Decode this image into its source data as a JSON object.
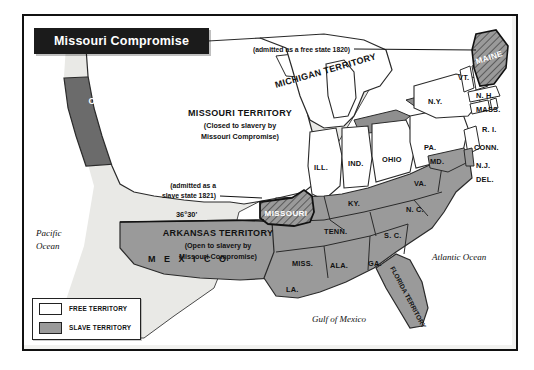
{
  "figure": {
    "title": "Missouri Compromise",
    "kind": "historical-thematic-map"
  },
  "legend": {
    "items": [
      {
        "label": "FREE TERRITORY",
        "swatch": "free",
        "color": "#ffffff"
      },
      {
        "label": "SLAVE TERRITORY",
        "swatch": "slave",
        "color": "#9a9a9a"
      }
    ]
  },
  "colors": {
    "free": "#ffffff",
    "slave": "#9a9a9a",
    "oregon": "#6b6b6b",
    "unorganized": "#e9e9e6",
    "water": "#ffffff",
    "banner": "#1b1b1b",
    "ink": "#111111",
    "frame": "#111111"
  },
  "territories": [
    {
      "name": "OREGON COUNTRY",
      "note_lines": [
        "(Jointly Claimed by",
        "British and the",
        "United States)"
      ],
      "fill": "oregon",
      "text_color": "#ffffff"
    },
    {
      "name": "MISSOURI TERRITORY",
      "note_lines": [
        "(Closed to slavery by",
        "Missouri Compromise)"
      ],
      "fill": "free",
      "text_color": "#111111"
    },
    {
      "name": "ARKANSAS TERRITORY",
      "note_lines": [
        "(Open to slavery by",
        "Missouri Compromise)"
      ],
      "fill": "slave",
      "text_color": "#111111"
    },
    {
      "name": "MICHIGAN TERRITORY",
      "fill": "free",
      "text_color": "#111111"
    },
    {
      "name": "FLORIDA TERRITORY",
      "fill": "slave",
      "text_color": "#111111"
    }
  ],
  "callouts": [
    {
      "text": "(admitted as a free state 1820)",
      "target": "MAINE"
    },
    {
      "text_lines": [
        "(admitted as a",
        "slave state 1821)"
      ],
      "target": "MISSOURI"
    }
  ],
  "parallel": {
    "label": "36°30'"
  },
  "highlighted_states": [
    {
      "name": "MAINE",
      "status": "free",
      "pattern": "hatched"
    },
    {
      "name": "MISSOURI",
      "status": "slave",
      "pattern": "hatched"
    }
  ],
  "free_states": [
    {
      "abbr": "VT."
    },
    {
      "abbr": "N. H."
    },
    {
      "abbr": "MASS."
    },
    {
      "abbr": "R. I."
    },
    {
      "abbr": "CONN."
    },
    {
      "abbr": "N.Y."
    },
    {
      "abbr": "N.J."
    },
    {
      "abbr": "PA."
    },
    {
      "abbr": "OHIO"
    },
    {
      "abbr": "IND."
    },
    {
      "abbr": "ILL."
    }
  ],
  "slave_states": [
    {
      "abbr": "DEL."
    },
    {
      "abbr": "MD."
    },
    {
      "abbr": "VA."
    },
    {
      "abbr": "KY."
    },
    {
      "abbr": "N. C."
    },
    {
      "abbr": "TENN."
    },
    {
      "abbr": "S. C."
    },
    {
      "abbr": "GA."
    },
    {
      "abbr": "ALA."
    },
    {
      "abbr": "MISS."
    },
    {
      "abbr": "LA."
    }
  ],
  "geo_labels": {
    "pacific": [
      "Pacific",
      "Ocean"
    ],
    "atlantic": "Atlantic Ocean",
    "gulf": "Gulf of Mexico",
    "mexico": "M E X I C O"
  }
}
